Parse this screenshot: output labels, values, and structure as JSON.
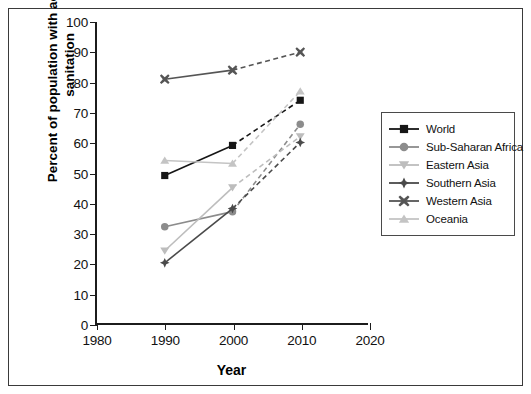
{
  "chart_data": {
    "type": "line",
    "title": "",
    "xlabel": "Year",
    "ylabel": "Percent of population with access to sanitation",
    "ylabel_line1": "Percent of population with access to",
    "ylabel_line2": "sanitation",
    "x": [
      1990,
      2000,
      2010
    ],
    "xlim": [
      1980,
      2020
    ],
    "ylim": [
      0,
      100
    ],
    "xticks": [
      "1980",
      "1990",
      "2000",
      "2010",
      "2020"
    ],
    "yticks": [
      "0",
      "10",
      "20",
      "30",
      "40",
      "50",
      "60",
      "70",
      "80",
      "90",
      "100"
    ],
    "grid": false,
    "legend_position": "right",
    "line_styles": {
      "segment_1990_2000": "solid",
      "segment_2000_2010": "dashed"
    },
    "series": [
      {
        "name": "World",
        "values": [
          49,
          59,
          74
        ],
        "color": "#161616",
        "marker": "square"
      },
      {
        "name": "Sub-Saharan Africa",
        "values": [
          32,
          37,
          66
        ],
        "color": "#8c8c8c",
        "marker": "circle"
      },
      {
        "name": "Eastern Asia",
        "values": [
          24,
          45,
          62
        ],
        "color": "#bdbdbd",
        "marker": "triangle-down"
      },
      {
        "name": "Southern Asia",
        "values": [
          20,
          38,
          60
        ],
        "color": "#4a4a4a",
        "marker": "diamond-plus"
      },
      {
        "name": "Western Asia",
        "values": [
          81,
          84,
          90
        ],
        "color": "#555555",
        "marker": "x-cross"
      },
      {
        "name": "Oceania",
        "values": [
          54,
          53,
          77
        ],
        "color": "#c4c4c4",
        "marker": "triangle-up"
      }
    ]
  }
}
